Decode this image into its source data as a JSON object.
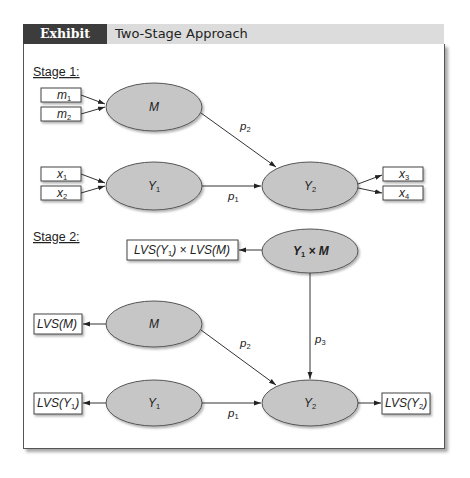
{
  "header": {
    "label": "Exhibit 8.11",
    "title": "Two-Stage Approach"
  },
  "colors": {
    "header_label_bg": "#3c3c3c",
    "header_bar_bg": "#dcdcdc",
    "ellipse_fill": "#c6c6c6",
    "ellipse_stroke": "#555555",
    "line": "#333333"
  },
  "stage1": {
    "title": "Stage 1:",
    "indicators": {
      "m1": {
        "base": "m",
        "sub": "1"
      },
      "m2": {
        "base": "m",
        "sub": "2"
      },
      "x1": {
        "base": "x",
        "sub": "1"
      },
      "x2": {
        "base": "x",
        "sub": "2"
      },
      "x3": {
        "base": "x",
        "sub": "3"
      },
      "x4": {
        "base": "x",
        "sub": "4"
      }
    },
    "constructs": {
      "M": {
        "base": "M",
        "sub": ""
      },
      "Y1": {
        "base": "Y",
        "sub": "1"
      },
      "Y2": {
        "base": "Y",
        "sub": "2"
      }
    },
    "paths": {
      "p1": {
        "base": "p",
        "sub": "1"
      },
      "p2": {
        "base": "p",
        "sub": "2"
      }
    }
  },
  "stage2": {
    "title": "Stage 2:",
    "indicators": {
      "lvs_interaction": {
        "pre": "LVS(Y",
        "sub": "1",
        "post": ") × LVS(M)"
      },
      "lvs_m": {
        "pre": "LVS(M)",
        "sub": "",
        "post": ""
      },
      "lvs_y1": {
        "pre": "LVS(Y",
        "sub": "1",
        "post": ")"
      },
      "lvs_y2": {
        "pre": "LVS(Y",
        "sub": "2",
        "post": ")"
      }
    },
    "constructs": {
      "interaction": {
        "pre": "Y",
        "sub": "1",
        "post": " × M"
      },
      "M": {
        "base": "M",
        "sub": ""
      },
      "Y1": {
        "base": "Y",
        "sub": "1"
      },
      "Y2": {
        "base": "Y",
        "sub": "2"
      }
    },
    "paths": {
      "p1": {
        "base": "p",
        "sub": "1"
      },
      "p2": {
        "base": "p",
        "sub": "2"
      },
      "p3": {
        "base": "p",
        "sub": "3"
      }
    }
  }
}
